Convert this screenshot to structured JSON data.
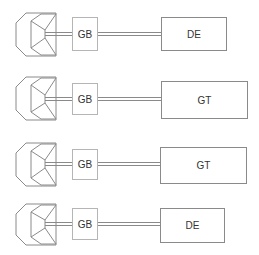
{
  "diagram": {
    "type": "drivetrain-schematic",
    "colors": {
      "line": "#8a8a8a",
      "gb_border": "#b5b5b5",
      "text": "#333333",
      "background": "#ffffff"
    },
    "rows": [
      {
        "id": "row-1",
        "source": "engine-inlet",
        "coupling": "GB",
        "driver": "DE",
        "icon": {
          "x": 16,
          "y": 13,
          "w": 40,
          "h": 43
        },
        "gb": {
          "x": 72,
          "y": 17,
          "w": 25,
          "h": 33
        },
        "shaft_y": 34,
        "box": {
          "x": 161,
          "y": 17,
          "w": 65,
          "h": 33
        }
      },
      {
        "id": "row-2",
        "source": "engine-inlet",
        "coupling": "GB",
        "driver": "GT",
        "icon": {
          "x": 16,
          "y": 77,
          "w": 40,
          "h": 43
        },
        "gb": {
          "x": 72,
          "y": 83,
          "w": 25,
          "h": 31
        },
        "shaft_y": 99,
        "box": {
          "x": 161,
          "y": 81,
          "w": 86,
          "h": 37
        }
      },
      {
        "id": "row-3",
        "source": "engine-inlet",
        "coupling": "GB",
        "driver": "GT",
        "icon": {
          "x": 16,
          "y": 143,
          "w": 40,
          "h": 43
        },
        "gb": {
          "x": 72,
          "y": 149,
          "w": 25,
          "h": 30
        },
        "shaft_y": 164,
        "box": {
          "x": 160,
          "y": 147,
          "w": 86,
          "h": 36
        }
      },
      {
        "id": "row-4",
        "source": "engine-inlet",
        "coupling": "GB",
        "driver": "DE",
        "icon": {
          "x": 16,
          "y": 204,
          "w": 40,
          "h": 41
        },
        "gb": {
          "x": 72,
          "y": 208,
          "w": 25,
          "h": 31
        },
        "shaft_y": 224,
        "box": {
          "x": 160,
          "y": 208,
          "w": 64,
          "h": 34
        }
      }
    ]
  }
}
